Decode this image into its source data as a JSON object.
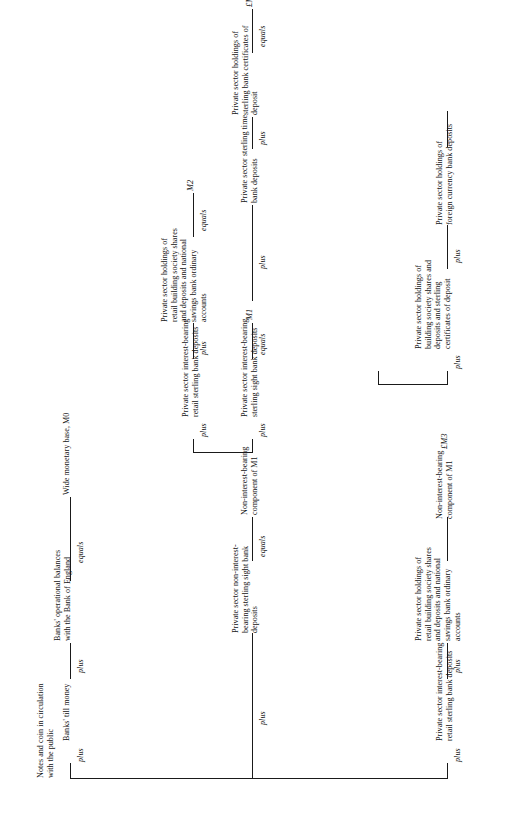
{
  "diagram": {
    "type": "flow-chart",
    "orientation": "rotated-90-ccw",
    "operators": {
      "plus": "plus",
      "equals": "equals"
    },
    "nodes": {
      "notes_and_coin": "Notes and coin in circulation\nwith the public",
      "banks_till_money": "Banks' till money",
      "banks_operational_balances": "Banks' operational balances\nwith the Bank of England",
      "wide_monetary_base": "Wide monetary base, M0",
      "ps_non_int_sight": "Private sector non-interest-\nbearing sterling sight bank\ndeposits",
      "non_int_component_m1": "Non-interest-bearing\ncomponent of M1",
      "ps_int_sight": "Private sector interest-bearing\nsterling sight bank deposits",
      "m1": "M1",
      "ps_int_retail_sterling": "Private sector interest-bearing\nretail sterling bank deposits",
      "ps_retail_bs_shares_nsb": "Private sector holdings of\nretail building society shares\nand deposits and national\nsavings bank ordinary\naccounts",
      "m2": "M2",
      "ps_sterling_time": "Private sector sterling time\nbank deposits",
      "ps_sterling_cds": "Private sector holdings of\nsterling bank certificates of\ndeposit",
      "m3_sterling": "£M3",
      "ps_bs_shares_deposits_cds": "Private sector holdings of\nbuilding society shares and\ndeposits and sterling\ncertificates of deposit",
      "ps_foreign_currency": "Private sector holdings of\nforeign currency bank deposits"
    },
    "rows": [
      {
        "id": "row-m0",
        "sequence": [
          {
            "node": "notes_and_coin"
          },
          {
            "op": "plus"
          },
          {
            "node": "banks_till_money"
          },
          {
            "op": "plus"
          },
          {
            "node": "banks_operational_balances"
          },
          {
            "op": "equals"
          },
          {
            "node": "wide_monetary_base"
          }
        ]
      },
      {
        "id": "row-m1",
        "sequence": [
          {
            "node": "notes_and_coin"
          },
          {
            "op": "plus"
          },
          {
            "node": "ps_non_int_sight"
          },
          {
            "op": "equals"
          },
          {
            "node": "non_int_component_m1"
          },
          {
            "op": "plus"
          },
          {
            "node": "ps_int_sight"
          },
          {
            "op": "equals"
          },
          {
            "node": "m1"
          }
        ]
      },
      {
        "id": "row-m2",
        "sequence": [
          {
            "node": "non_int_component_m1"
          },
          {
            "op": "plus"
          },
          {
            "node": "ps_int_retail_sterling"
          },
          {
            "op": "plus"
          },
          {
            "node": "ps_retail_bs_shares_nsb"
          },
          {
            "op": "equals"
          },
          {
            "node": "m2"
          }
        ]
      },
      {
        "id": "row-sterling-m3",
        "sequence": [
          {
            "node": "m1"
          },
          {
            "op": "plus"
          },
          {
            "node": "ps_sterling_time"
          },
          {
            "op": "plus"
          },
          {
            "node": "ps_sterling_cds"
          },
          {
            "op": "equals"
          },
          {
            "node": "m3_sterling"
          }
        ]
      },
      {
        "id": "row-m4-m5",
        "sequence": [
          {
            "node": "m3_sterling"
          },
          {
            "op": "plus"
          },
          {
            "node": "ps_bs_shares_deposits_cds"
          },
          {
            "op": "plus"
          },
          {
            "node": "ps_foreign_currency"
          }
        ]
      }
    ]
  }
}
